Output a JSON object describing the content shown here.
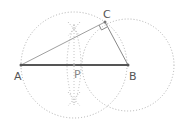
{
  "diagram": {
    "points": {
      "A": {
        "label": "A",
        "x": 21,
        "y": 65
      },
      "B": {
        "label": "B",
        "x": 128,
        "y": 65
      },
      "C": {
        "label": "C",
        "x": 105,
        "y": 22
      },
      "P": {
        "label": "P",
        "x": 74,
        "y": 65
      }
    },
    "circles": [
      {
        "name": "thales-circle",
        "center": "P",
        "radius": 53,
        "style": "dotted"
      },
      {
        "name": "circle-b",
        "center": "B",
        "radius": 46,
        "style": "dotted"
      }
    ],
    "segments": [
      {
        "from": "A",
        "to": "B",
        "style": "thick"
      },
      {
        "from": "A",
        "to": "C",
        "style": "thin"
      },
      {
        "from": "C",
        "to": "B",
        "style": "thin"
      }
    ],
    "right_angle_at": "C",
    "colors": {
      "main_segment": "#555555",
      "thin_segment": "#999999",
      "construction": "#aaaaaa",
      "label": "#555555"
    }
  }
}
